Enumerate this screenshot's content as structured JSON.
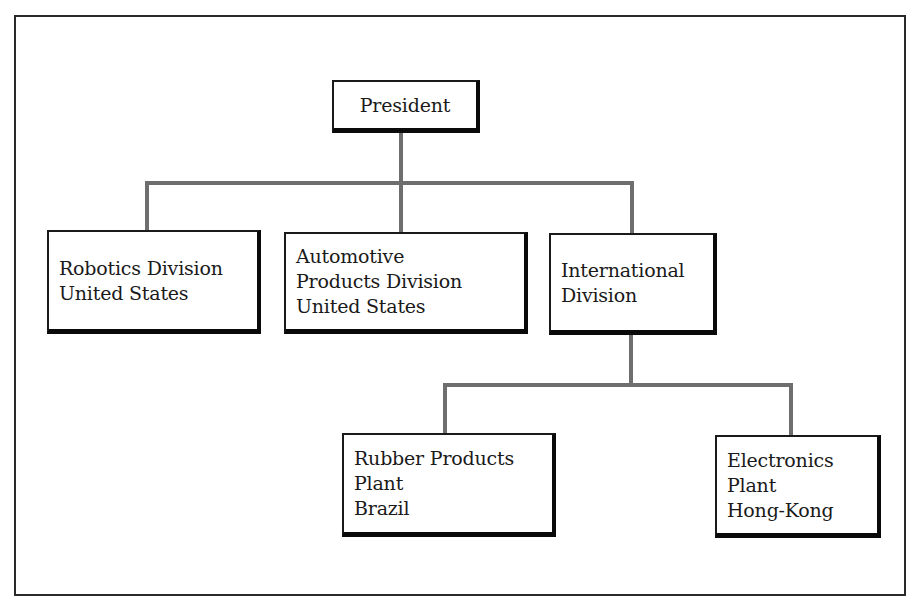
{
  "diagram": {
    "type": "organization-chart",
    "nodes": [
      {
        "id": "president",
        "lines": [
          "President"
        ],
        "parent": null
      },
      {
        "id": "robotics",
        "lines": [
          "Robotics Division",
          "United States"
        ],
        "parent": "president"
      },
      {
        "id": "automotive",
        "lines": [
          "Automotive",
          "Products Division",
          "United States"
        ],
        "parent": "president"
      },
      {
        "id": "international",
        "lines": [
          "International",
          "Division"
        ],
        "parent": "president"
      },
      {
        "id": "rubber",
        "lines": [
          "Rubber Products",
          "Plant",
          "Brazil"
        ],
        "parent": "international"
      },
      {
        "id": "electronics",
        "lines": [
          "Electronics",
          "Plant",
          "Hong-Kong"
        ],
        "parent": "international"
      }
    ],
    "colors": {
      "connector": "#6e6e6e",
      "box_border": "#0a0a0a",
      "background": "#ffffff"
    }
  }
}
